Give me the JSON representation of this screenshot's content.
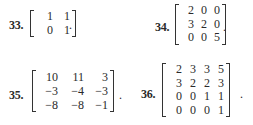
{
  "exercises": [
    {
      "number": "33.",
      "rows": [
        [
          "1",
          "1"
        ],
        [
          "0",
          "1"
        ]
      ]
    },
    {
      "number": "34.",
      "rows": [
        [
          "2",
          "0",
          "0"
        ],
        [
          "3",
          "2",
          "0"
        ],
        [
          "0",
          "0",
          "5"
        ]
      ]
    },
    {
      "number": "35.",
      "rows": [
        [
          "10",
          "11",
          "3"
        ],
        [
          "−3",
          "−4",
          "−3"
        ],
        [
          "−8",
          "−8",
          "−1"
        ]
      ]
    },
    {
      "number": "36.",
      "rows": [
        [
          "2",
          "3",
          "3",
          "5"
        ],
        [
          "3",
          "2",
          "2",
          "3"
        ],
        [
          "0",
          "0",
          "1",
          "1"
        ],
        [
          "0",
          "0",
          "0",
          "1"
        ]
      ]
    }
  ],
  "terminator": "."
}
